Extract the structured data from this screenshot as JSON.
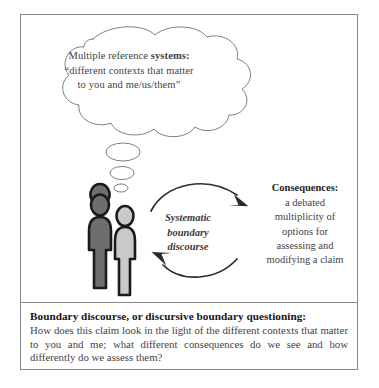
{
  "figure": {
    "frame_border_color": "#8a8a8a",
    "background_color": "#ffffff"
  },
  "thought_bubble": {
    "name": "multiple-reference-systems-thought",
    "line1_prefix": "Multiple reference ",
    "line1_bold": "systems:",
    "line2": "“different contexts that matter",
    "line3": "to you and me/us/them”"
  },
  "people": {
    "left_figure_fill": "#6e6e6e",
    "right_figure_fill": "#c9c9c9",
    "outline_color": "#1a1a1a"
  },
  "cycle": {
    "label_line1": "Systematic",
    "label_line2": "boundary",
    "label_line3": "discourse",
    "arrow_color": "#2b2b2b"
  },
  "consequences": {
    "title": "Consequences:",
    "lines": [
      "a debated",
      "multiplicity of",
      "options for",
      "assessing and",
      "modifying a claim"
    ]
  },
  "caption": {
    "title": "Boundary discourse, or discursive boundary questioning:",
    "body": "How does this claim look in the light of the different contexts that matter to you and me; what different consequences do we see and how differently do we assess them?"
  }
}
